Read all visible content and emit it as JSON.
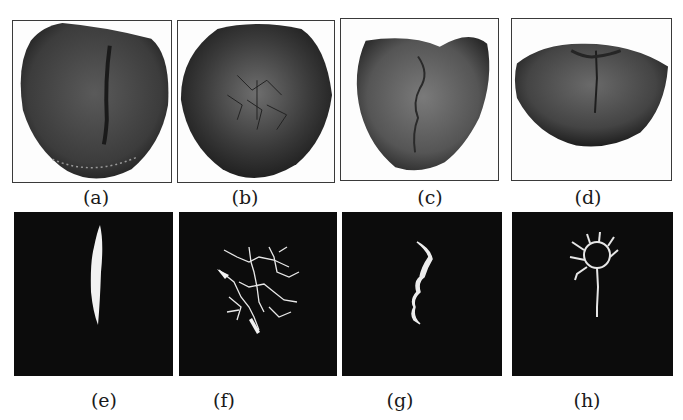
{
  "figure": {
    "panels": [
      {
        "id": "a",
        "label": "(a)",
        "type": "tongue-photo",
        "description": "tongue with single central fissure"
      },
      {
        "id": "b",
        "label": "(b)",
        "type": "tongue-photo",
        "description": "tongue with network of cracks"
      },
      {
        "id": "c",
        "label": "(c)",
        "type": "tongue-photo",
        "description": "tongue with jagged central crack"
      },
      {
        "id": "d",
        "label": "(d)",
        "type": "tongue-photo",
        "description": "tongue with radial crack pattern"
      },
      {
        "id": "e",
        "label": "(e)",
        "type": "binary-mask",
        "description": "segmented straight fissure"
      },
      {
        "id": "f",
        "label": "(f)",
        "type": "binary-mask",
        "description": "segmented branching crack network"
      },
      {
        "id": "g",
        "label": "(g)",
        "type": "binary-mask",
        "description": "segmented wavy crack"
      },
      {
        "id": "h",
        "label": "(h)",
        "type": "binary-mask",
        "description": "segmented ring with stem crack"
      }
    ]
  }
}
